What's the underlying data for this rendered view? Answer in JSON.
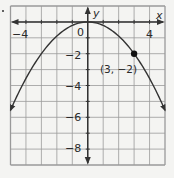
{
  "chart_data": {
    "type": "line",
    "title": "",
    "xlabel": "x",
    "ylabel": "y",
    "xlim": [
      -5,
      5
    ],
    "ylim": [
      -9,
      1
    ],
    "grid": true,
    "x_ticks_labeled": [
      -4,
      4
    ],
    "y_ticks_labeled": [
      -2,
      -4,
      -6,
      -8
    ],
    "origin_label": "0",
    "x_tick_labels": [
      "−4",
      "4"
    ],
    "y_tick_labels": [
      "−2",
      "−4",
      "−6",
      "−8"
    ],
    "series": [
      {
        "name": "y = -(2/9)x^2",
        "equation": "y = -2/9 x^2",
        "x": [
          -5,
          -4,
          -3,
          -2,
          -1,
          0,
          1,
          2,
          3,
          4,
          5
        ],
        "y": [
          -5.56,
          -3.56,
          -2,
          -0.89,
          -0.22,
          0,
          -0.22,
          -0.89,
          -2,
          -3.56,
          -5.56
        ],
        "arrows_at_ends": true
      }
    ],
    "annotations": [
      {
        "point": [
          3,
          -2
        ],
        "label": "(3, −2)",
        "marker": "filled-circle"
      }
    ]
  },
  "colors": {
    "grid": "#9a9a9a",
    "axis": "#333333",
    "curve": "#333333",
    "background": "#f4f4f2"
  }
}
